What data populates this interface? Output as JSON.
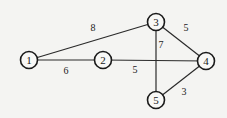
{
  "graph": {
    "nodes": [
      {
        "id": "1",
        "label": "1",
        "x": 29,
        "y": 60
      },
      {
        "id": "2",
        "label": "2",
        "x": 103,
        "y": 60
      },
      {
        "id": "3",
        "label": "3",
        "x": 156,
        "y": 22
      },
      {
        "id": "4",
        "label": "4",
        "x": 206,
        "y": 61
      },
      {
        "id": "5",
        "label": "5",
        "x": 156,
        "y": 100
      }
    ],
    "edges": [
      {
        "from": "1",
        "to": "3",
        "weight": "8",
        "lx": 93,
        "ly": 31
      },
      {
        "from": "1",
        "to": "2",
        "weight": "6",
        "lx": 66,
        "ly": 74
      },
      {
        "from": "2",
        "to": "4",
        "weight": "5",
        "lx": 135,
        "ly": 73
      },
      {
        "from": "3",
        "to": "5",
        "weight": "7",
        "lx": 161,
        "ly": 48
      },
      {
        "from": "3",
        "to": "4",
        "weight": "5",
        "lx": 186,
        "ly": 31
      },
      {
        "from": "4",
        "to": "5",
        "weight": "3",
        "lx": 184,
        "ly": 95
      }
    ],
    "node_radius": 8.5
  }
}
